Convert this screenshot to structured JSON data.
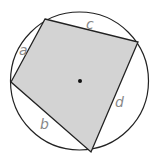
{
  "diagram": {
    "circle": {
      "cx": 79.5,
      "cy": 81,
      "r": 69,
      "stroke": "#222222"
    },
    "quad": {
      "points": "45,19 138,42 91,152 11,82",
      "fill": "#d3d3d3",
      "stroke": "#222222"
    },
    "center_dot": {
      "cx": 80,
      "cy": 81,
      "r": 2
    },
    "labels": [
      {
        "text": "a",
        "x": 19,
        "y": 55
      },
      {
        "text": "c",
        "x": 86,
        "y": 29
      },
      {
        "text": "d",
        "x": 115,
        "y": 107
      },
      {
        "text": "b",
        "x": 40,
        "y": 129
      }
    ]
  }
}
